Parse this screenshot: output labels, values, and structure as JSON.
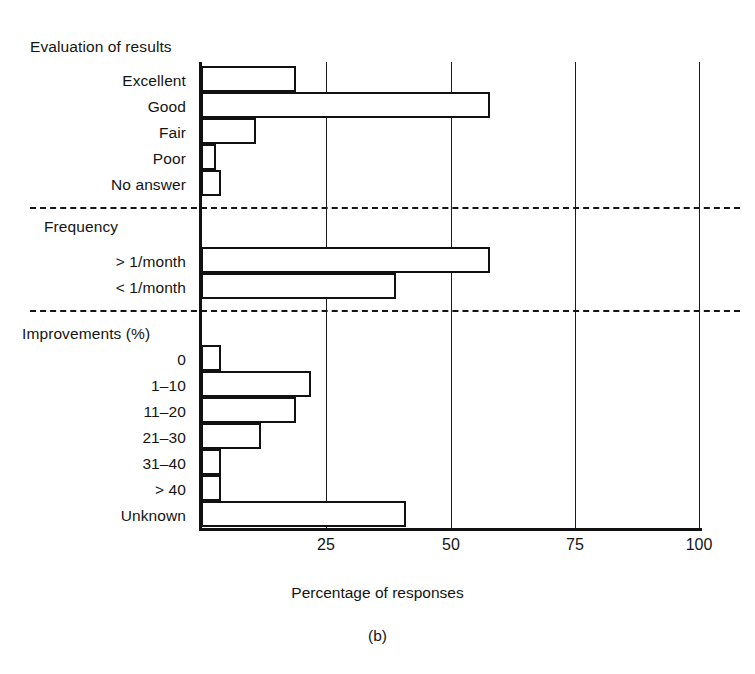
{
  "figure": {
    "caption": "(b)",
    "xlabel": "Percentage of responses"
  },
  "axis": {
    "ticks": [
      {
        "value": 0,
        "label": ""
      },
      {
        "value": 25,
        "label": "25"
      },
      {
        "value": 50,
        "label": "50"
      },
      {
        "value": 75,
        "label": "75"
      },
      {
        "value": 100,
        "label": "100"
      }
    ],
    "xmin": 0,
    "xmax": 100
  },
  "groups": [
    {
      "title": "Evaluation of results",
      "categories": [
        "Excellent",
        "Good",
        "Fair",
        "Poor",
        "No answer"
      ],
      "values": [
        19,
        58,
        11,
        3,
        4
      ]
    },
    {
      "title": "Frequency",
      "categories": [
        "> 1/month",
        "< 1/month"
      ],
      "values": [
        58,
        39
      ]
    },
    {
      "title": "Improvements (%)",
      "categories": [
        "0",
        "1–10",
        "11–20",
        "21–30",
        "31–40",
        "> 40",
        "Unknown"
      ],
      "values": [
        4,
        22,
        19,
        12,
        4,
        4,
        41
      ]
    }
  ],
  "chart_data": {
    "type": "bar",
    "orientation": "horizontal",
    "title": "",
    "subtitle": "",
    "xlabel": "Percentage of responses",
    "ylabel": "",
    "xlim": [
      0,
      100
    ],
    "xticks": [
      25,
      50,
      75,
      100
    ],
    "grid": "vertical-only",
    "legend": "none",
    "annotations": [
      "(b)"
    ],
    "group_separators": [
      "dashed",
      "dashed"
    ],
    "groups": [
      {
        "name": "Evaluation of results",
        "categories": [
          "Excellent",
          "Good",
          "Fair",
          "Poor",
          "No answer"
        ],
        "values": [
          19,
          58,
          11,
          3,
          4
        ]
      },
      {
        "name": "Frequency",
        "categories": [
          "> 1/month",
          "< 1/month"
        ],
        "values": [
          58,
          39
        ]
      },
      {
        "name": "Improvements (%)",
        "categories": [
          "0",
          "1–10",
          "11–20",
          "21–30",
          "31–40",
          "> 40",
          "Unknown"
        ],
        "values": [
          4,
          22,
          19,
          12,
          4,
          4,
          41
        ]
      }
    ],
    "categories": [
      "Excellent",
      "Good",
      "Fair",
      "Poor",
      "No answer",
      "> 1/month",
      "< 1/month",
      "0",
      "1–10",
      "11–20",
      "21–30",
      "31–40",
      "> 40",
      "Unknown"
    ],
    "values": [
      19,
      58,
      11,
      3,
      4,
      58,
      39,
      4,
      22,
      19,
      12,
      4,
      4,
      41
    ]
  },
  "layout": {
    "plot_left": 201,
    "plot_top": 62,
    "plot_width": 499,
    "plot_height": 466,
    "bar_height": 26,
    "rows": {
      "g0_start": 66,
      "g1_start": 247,
      "g2_start": 345
    },
    "separators_y": [
      207,
      310
    ],
    "group_title_y": [
      38,
      218,
      325
    ],
    "label_y": {
      "g0": [
        72,
        98,
        124,
        150,
        176
      ],
      "g1": [
        253,
        279
      ],
      "g2": [
        351,
        377,
        403,
        429,
        455,
        481,
        507
      ]
    }
  },
  "colors": {
    "ink": "#111111",
    "background": "#ffffff"
  }
}
